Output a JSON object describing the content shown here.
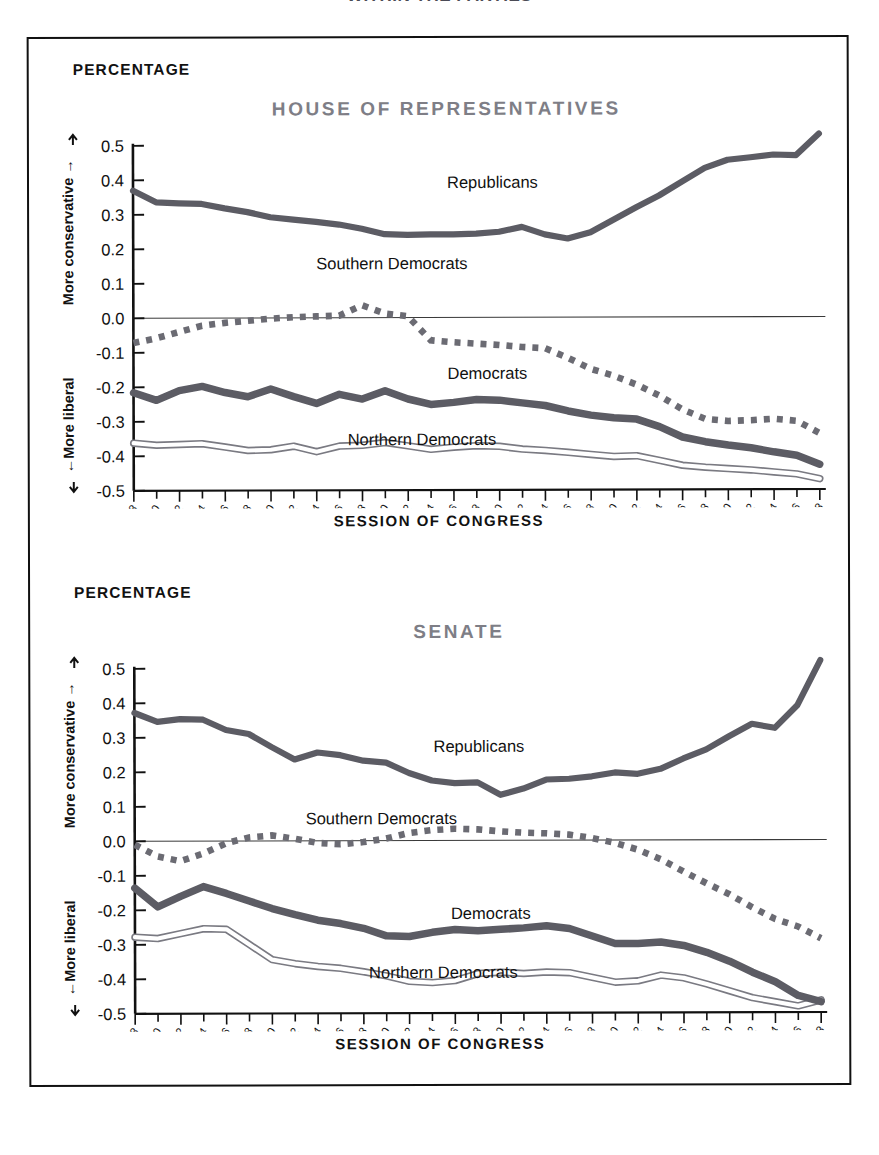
{
  "clipped_headline": "WITHIN THE PARTIES",
  "axis": {
    "y_title": "PERCENTAGE",
    "x_title": "SESSION OF CONGRESS",
    "y_ticks": [
      "0.5",
      "0.4",
      "0.3",
      "0.2",
      "0.1",
      "0.0",
      "-0.1",
      "-0.2",
      "-0.3",
      "-0.4",
      "-0.5"
    ],
    "y_tick_values": [
      0.5,
      0.4,
      0.3,
      0.2,
      0.1,
      0.0,
      -0.1,
      -0.2,
      -0.3,
      -0.4,
      -0.5
    ],
    "direction_up": "More conservative",
    "direction_down": "More liberal",
    "up_arrow": "→",
    "down_arrow": "←"
  },
  "colors": {
    "title_gray": "#7e7e86",
    "line_gray": "#5c5c64",
    "dotted_gray": "#6b6b73",
    "outline_gray": "#7a7a82",
    "axis_black": "#111111",
    "frame_black": "#111111",
    "background": "#ffffff"
  },
  "series_labels": {
    "republicans": "Republicans",
    "democrats": "Democrats",
    "southern_democrats": "Southern Democrats",
    "northern_democrats": "Northern Democrats"
  },
  "chart_data": [
    {
      "type": "line",
      "title": "HOUSE OF REPRESENTATIVES",
      "xlabel": "SESSION OF CONGRESS",
      "ylabel": "PERCENTAGE",
      "ylim": [
        -0.5,
        0.5
      ],
      "grid": false,
      "legend": "inline-annotations",
      "categories": [
        "1947–48",
        "1949–50",
        "1951–52",
        "1953–54",
        "1955–56",
        "1957–58",
        "1959–60",
        "1961–62",
        "1963–64",
        "1965–66",
        "1967–68",
        "1969–70",
        "1971–72",
        "1973–74",
        "1975–76",
        "1977–78",
        "1979–80",
        "1981–82",
        "1983–84",
        "1985–86",
        "1987–88",
        "1989–90",
        "1991–92",
        "1993–94",
        "1995–96",
        "1997–98",
        "1999–2000",
        "2001–02",
        "2003–04",
        "2005–06",
        "2007–08"
      ],
      "series": [
        {
          "name": "Republicans",
          "style": "thick-solid",
          "values": [
            0.37,
            0.336,
            0.333,
            0.331,
            0.318,
            0.307,
            0.292,
            0.285,
            0.278,
            0.27,
            0.258,
            0.242,
            0.24,
            0.241,
            0.241,
            0.24,
            0.241,
            0.242,
            0.237,
            0.231,
            0.229,
            0.24,
            0.262,
            0.289,
            0.315,
            0.33,
            0.338,
            0.337,
            0.344,
            0.358,
            0.375
          ]
        },
        {
          "name": "Southern Democrats",
          "style": "dotted",
          "values": [
            -0.072,
            -0.061,
            -0.05,
            -0.04,
            -0.029,
            -0.021,
            -0.012,
            -0.006,
            -0.004,
            -0.002,
            0.0,
            0.001,
            0.002,
            0.002,
            0.003,
            0.004,
            0.005,
            0.012,
            0.026,
            0.041,
            0.021,
            0.01,
            0.007,
            -0.035,
            -0.071,
            -0.084,
            -0.09,
            -0.095,
            -0.097,
            -0.1,
            -0.102
          ]
        },
        {
          "name": "Democrats",
          "style": "thick-solid",
          "values": [
            -0.205,
            -0.238,
            -0.22,
            -0.2,
            -0.213,
            -0.226,
            -0.211,
            -0.228,
            -0.248,
            -0.225,
            -0.239,
            -0.212,
            -0.233,
            -0.249,
            -0.246,
            -0.24,
            -0.232,
            -0.242,
            -0.237,
            -0.245,
            -0.259,
            -0.264,
            -0.268,
            -0.281,
            -0.293,
            -0.292,
            -0.294,
            -0.292,
            -0.293,
            -0.3,
            -0.305
          ]
        },
        {
          "name": "Northern Democrats",
          "style": "outline",
          "values": [
            -0.363,
            -0.368,
            -0.367,
            -0.366,
            -0.374,
            -0.382,
            -0.381,
            -0.373,
            -0.39,
            -0.374,
            -0.372,
            -0.362,
            -0.372,
            -0.38,
            -0.376,
            -0.37,
            -0.366,
            -0.373,
            -0.37,
            -0.374,
            -0.382,
            -0.386,
            -0.389,
            -0.394,
            -0.397,
            -0.396,
            -0.398,
            -0.396,
            -0.397,
            -0.403,
            -0.407
          ]
        }
      ],
      "series_values_extended": {
        "note": "Values below continue the four House series through the full 31 sessions as read from the plot.",
        "republicans_tail": [
          0.395,
          0.43,
          0.455,
          0.462,
          0.47,
          0.468,
          0.465,
          0.482,
          0.5,
          0.53
        ],
        "democrats_tail": [
          -0.305,
          -0.322,
          -0.34,
          -0.358,
          -0.378,
          -0.396,
          -0.41,
          -0.418,
          -0.425,
          -0.432
        ],
        "southern_tail": [
          -0.12,
          -0.17,
          -0.205,
          -0.24,
          -0.29,
          -0.308,
          -0.306,
          -0.3,
          -0.305,
          -0.338
        ],
        "northern_tail": [
          -0.408,
          -0.414,
          -0.42,
          -0.428,
          -0.436,
          -0.442,
          -0.448,
          -0.452,
          -0.456,
          -0.462
        ]
      }
    },
    {
      "type": "line",
      "title": "SENATE",
      "xlabel": "SESSION OF CONGRESS",
      "ylabel": "PERCENTAGE",
      "ylim": [
        -0.5,
        0.5
      ],
      "grid": false,
      "legend": "inline-annotations",
      "categories": [
        "1947–48",
        "1949–50",
        "1951–52",
        "1953–54",
        "1955–56",
        "1957–58",
        "1959–60",
        "1961–62",
        "1963–64",
        "1965–66",
        "1967–68",
        "1969–70",
        "1971–72",
        "1973–74",
        "1975–76",
        "1977–78",
        "1979–80",
        "1981–82",
        "1983–84",
        "1985–86",
        "1987–88",
        "1989–90",
        "1991–92",
        "1993–94",
        "1995–96",
        "1997–98",
        "1999–2000",
        "2001–02",
        "2003–04",
        "2005–06",
        "2007–08"
      ],
      "series": [
        {
          "name": "Republicans",
          "style": "thick-solid",
          "values": [
            0.372,
            0.346,
            0.354,
            0.352,
            0.322,
            0.31,
            0.272,
            0.236,
            0.256,
            0.248,
            0.232,
            0.226,
            0.196,
            0.174,
            0.166,
            0.168,
            0.132,
            0.15,
            0.176,
            0.178,
            0.185,
            0.196,
            0.192,
            0.206,
            0.222,
            0.238,
            0.262,
            0.292,
            0.282,
            0.32,
            0.372
          ]
        },
        {
          "name": "Southern Democrats",
          "style": "dotted",
          "values": [
            -0.01,
            -0.03,
            -0.055,
            -0.04,
            -0.012,
            0.006,
            0.012,
            0.01,
            0.0,
            -0.008,
            -0.006,
            0.0,
            0.012,
            0.022,
            0.026,
            0.028,
            0.024,
            0.022,
            0.024,
            0.022,
            0.014,
            0.004,
            -0.005,
            -0.018,
            -0.03,
            -0.06,
            -0.088,
            -0.11,
            -0.128,
            -0.142,
            -0.152
          ]
        },
        {
          "name": "Democrats",
          "style": "thick-solid",
          "values": [
            -0.136,
            -0.19,
            -0.16,
            -0.133,
            -0.15,
            -0.172,
            -0.192,
            -0.212,
            -0.228,
            -0.236,
            -0.252,
            -0.276,
            -0.272,
            -0.262,
            -0.258,
            -0.262,
            -0.258,
            -0.256,
            -0.248,
            -0.254,
            -0.276,
            -0.3,
            -0.3,
            -0.296,
            -0.292,
            -0.288,
            -0.284,
            -0.3,
            -0.32,
            -0.348,
            -0.37
          ]
        },
        {
          "name": "Northern Democrats",
          "style": "outline",
          "values": [
            -0.278,
            -0.282,
            -0.268,
            -0.254,
            -0.256,
            -0.3,
            -0.344,
            -0.356,
            -0.364,
            -0.37,
            -0.38,
            -0.392,
            -0.408,
            -0.412,
            -0.406,
            -0.386,
            -0.382,
            -0.386,
            -0.382,
            -0.384,
            -0.398,
            -0.412,
            -0.408,
            -0.392,
            -0.384,
            -0.382,
            -0.388,
            -0.404,
            -0.424,
            -0.452,
            -0.478
          ]
        }
      ],
      "series_values_extended": {
        "note": "Senate tails as read off the plot, ending near -0.47 for Democrats and Northern Democrats and +0.52 for Republicans.",
        "republicans_tail": [
          0.4,
          0.408,
          0.412,
          0.404,
          0.41,
          0.434,
          0.452,
          0.47,
          0.49,
          0.52
        ],
        "democrats_tail": [
          -0.3,
          -0.31,
          -0.33,
          -0.352,
          -0.382,
          -0.406,
          -0.424,
          -0.44,
          -0.47,
          -0.452
        ],
        "southern_tail": [
          -0.2,
          -0.24,
          -0.268,
          -0.284,
          -0.3,
          -0.286,
          -0.272,
          -0.268,
          -0.29,
          -0.312
        ],
        "northern_tail": [
          -0.32,
          -0.34,
          -0.364,
          -0.388,
          -0.414,
          -0.436,
          -0.452,
          -0.466,
          -0.488,
          -0.472
        ]
      }
    }
  ],
  "house_full": {
    "republicans": [
      0.37,
      0.336,
      0.333,
      0.331,
      0.318,
      0.307,
      0.292,
      0.285,
      0.278,
      0.27,
      0.258,
      0.242,
      0.24,
      0.241,
      0.241,
      0.243,
      0.248,
      0.262,
      0.24,
      0.228,
      0.246,
      0.282,
      0.318,
      0.352,
      0.392,
      0.432,
      0.455,
      0.462,
      0.47,
      0.468,
      0.53
    ],
    "southern_democrats": [
      -0.072,
      -0.058,
      -0.04,
      -0.022,
      -0.014,
      -0.008,
      -0.002,
      0.002,
      0.004,
      0.006,
      0.036,
      0.012,
      0.004,
      -0.066,
      -0.072,
      -0.076,
      -0.08,
      -0.086,
      -0.09,
      -0.118,
      -0.15,
      -0.17,
      -0.196,
      -0.228,
      -0.268,
      -0.296,
      -0.302,
      -0.3,
      -0.296,
      -0.302,
      -0.338
    ],
    "democrats": [
      -0.216,
      -0.238,
      -0.21,
      -0.198,
      -0.216,
      -0.228,
      -0.206,
      -0.228,
      -0.248,
      -0.222,
      -0.236,
      -0.212,
      -0.236,
      -0.252,
      -0.246,
      -0.238,
      -0.24,
      -0.248,
      -0.256,
      -0.272,
      -0.284,
      -0.292,
      -0.296,
      -0.318,
      -0.348,
      -0.362,
      -0.372,
      -0.38,
      -0.392,
      -0.402,
      -0.428
    ],
    "northern_democrats": [
      -0.362,
      -0.368,
      -0.366,
      -0.364,
      -0.374,
      -0.384,
      -0.382,
      -0.372,
      -0.388,
      -0.372,
      -0.37,
      -0.362,
      -0.372,
      -0.382,
      -0.376,
      -0.372,
      -0.374,
      -0.382,
      -0.386,
      -0.392,
      -0.398,
      -0.404,
      -0.402,
      -0.416,
      -0.43,
      -0.436,
      -0.44,
      -0.444,
      -0.45,
      -0.456,
      -0.47
    ]
  },
  "senate_full": {
    "republicans": [
      0.372,
      0.346,
      0.354,
      0.352,
      0.322,
      0.31,
      0.272,
      0.236,
      0.256,
      0.248,
      0.232,
      0.226,
      0.196,
      0.174,
      0.166,
      0.168,
      0.132,
      0.15,
      0.176,
      0.178,
      0.185,
      0.196,
      0.192,
      0.206,
      0.236,
      0.262,
      0.3,
      0.336,
      0.324,
      0.39,
      0.52
    ],
    "southern_democrats": [
      -0.01,
      -0.044,
      -0.058,
      -0.036,
      -0.006,
      0.01,
      0.016,
      0.006,
      -0.006,
      -0.01,
      -0.004,
      0.006,
      0.022,
      0.03,
      0.034,
      0.032,
      0.026,
      0.022,
      0.02,
      0.016,
      0.006,
      -0.008,
      -0.028,
      -0.056,
      -0.092,
      -0.126,
      -0.158,
      -0.196,
      -0.23,
      -0.252,
      -0.286
    ],
    "democrats": [
      -0.136,
      -0.19,
      -0.16,
      -0.132,
      -0.152,
      -0.174,
      -0.196,
      -0.214,
      -0.23,
      -0.24,
      -0.254,
      -0.276,
      -0.278,
      -0.266,
      -0.258,
      -0.262,
      -0.258,
      -0.254,
      -0.248,
      -0.256,
      -0.278,
      -0.3,
      -0.3,
      -0.296,
      -0.306,
      -0.326,
      -0.352,
      -0.384,
      -0.412,
      -0.452,
      -0.47
    ],
    "northern_democrats": [
      -0.278,
      -0.282,
      -0.268,
      -0.254,
      -0.256,
      -0.3,
      -0.344,
      -0.356,
      -0.364,
      -0.37,
      -0.38,
      -0.392,
      -0.408,
      -0.412,
      -0.406,
      -0.386,
      -0.382,
      -0.386,
      -0.382,
      -0.384,
      -0.398,
      -0.412,
      -0.408,
      -0.392,
      -0.4,
      -0.418,
      -0.438,
      -0.458,
      -0.47,
      -0.482,
      -0.465
    ]
  },
  "annotations": {
    "house": [
      {
        "key": "republicans",
        "x": 418,
        "y": 150
      },
      {
        "key": "southern_democrats",
        "x": 287,
        "y": 231
      },
      {
        "key": "democrats",
        "x": 418,
        "y": 341
      },
      {
        "key": "northern_democrats",
        "x": 318,
        "y": 407
      }
    ],
    "senate": [
      {
        "key": "republicans",
        "x": 403,
        "y": 191
      },
      {
        "key": "southern_democrats",
        "x": 275,
        "y": 263
      },
      {
        "key": "democrats",
        "x": 420,
        "y": 358
      },
      {
        "key": "northern_democrats",
        "x": 338,
        "y": 417
      }
    ]
  }
}
